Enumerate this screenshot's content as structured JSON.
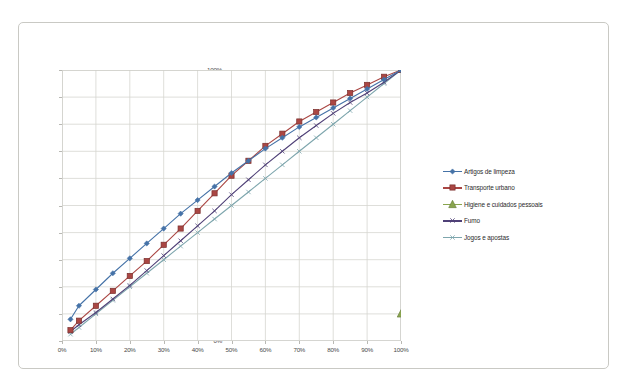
{
  "chart_data": {
    "type": "line",
    "title": "",
    "subtitle": "",
    "xlabel": "",
    "ylabel": "",
    "xlim": [
      0,
      100
    ],
    "ylim": [
      0,
      100
    ],
    "grid": true,
    "legend_position": "right",
    "x_ticks": [
      "0%",
      "10%",
      "20%",
      "30%",
      "40%",
      "50%",
      "60%",
      "70%",
      "80%",
      "90%",
      "100%"
    ],
    "y_ticks": [
      "0%",
      "10%",
      "20%",
      "30%",
      "40%",
      "50%",
      "60%",
      "70%",
      "80%",
      "90%",
      "100%"
    ],
    "x": [
      2.5,
      5,
      10,
      15,
      20,
      25,
      30,
      35,
      40,
      45,
      50,
      55,
      60,
      65,
      70,
      75,
      80,
      85,
      90,
      95,
      100
    ],
    "series": [
      {
        "name": "Artigos de limpeza",
        "color": "#4572A7",
        "marker": "diamond",
        "values": [
          8,
          13,
          19,
          25,
          30.5,
          36,
          41.5,
          47,
          52,
          57,
          62,
          66.5,
          71,
          75,
          79,
          82.5,
          86,
          89.5,
          93,
          96.5,
          100
        ]
      },
      {
        "name": "Transporte urbano",
        "color": "#AA4643",
        "marker": "square",
        "values": [
          4,
          7.5,
          13,
          18.5,
          24,
          29.5,
          35.5,
          41.5,
          48,
          54.5,
          61,
          66.5,
          72,
          76.5,
          81,
          84.5,
          88,
          91.5,
          94.5,
          97.5,
          100
        ]
      },
      {
        "name": "Higiene e cuidados pessoais",
        "color": "#89A54E",
        "marker": "triangle",
        "values": [
          null,
          null,
          null,
          null,
          null,
          null,
          null,
          null,
          null,
          null,
          null,
          null,
          null,
          null,
          null,
          null,
          null,
          null,
          null,
          null,
          10
        ]
      },
      {
        "name": "Fumo",
        "color": "#4F4077",
        "marker": "cross",
        "values": [
          3.5,
          6,
          10.5,
          15.5,
          20.5,
          26,
          31.5,
          37,
          42.5,
          48,
          54,
          59.5,
          65,
          70,
          75,
          79.5,
          84,
          88,
          91.5,
          95.5,
          100
        ]
      },
      {
        "name": "Jogos e apostas",
        "color": "#7EA6AD",
        "marker": "cross",
        "values": [
          2.5,
          5,
          10,
          15,
          20,
          25,
          30,
          35,
          40,
          45,
          50,
          55,
          60,
          65,
          70,
          75,
          80,
          85,
          90,
          95,
          100
        ]
      }
    ]
  },
  "legend": {
    "items": [
      {
        "label": "Artigos de limpeza"
      },
      {
        "label": "Transporte urbano"
      },
      {
        "label": "Higiene e cuidados pessoais"
      },
      {
        "label": "Fumo"
      },
      {
        "label": "Jogos e apostas"
      }
    ]
  }
}
